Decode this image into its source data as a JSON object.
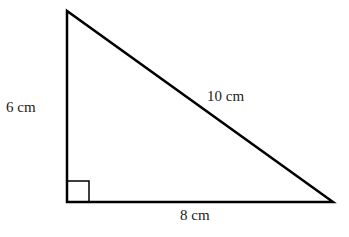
{
  "diagram": {
    "shape": "right triangle",
    "vertices": {
      "top": [
        67,
        11
      ],
      "right_angle": [
        67,
        202
      ],
      "bottom_right": [
        333,
        202
      ]
    },
    "labels": {
      "vertical_side": "6 cm",
      "horizontal_side": "8 cm",
      "hypotenuse": "10 cm"
    },
    "right_angle_marker": true,
    "stroke_color": "#000000"
  }
}
